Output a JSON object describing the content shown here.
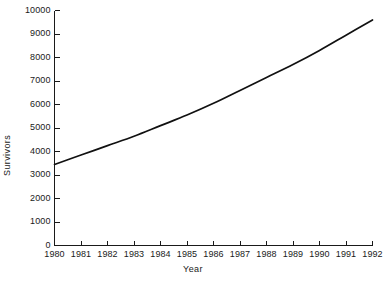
{
  "chart_data": {
    "type": "line",
    "title": "",
    "subtitle": "",
    "xlabel": "Year",
    "ylabel": "Survivors",
    "grid": false,
    "legend": false,
    "legend_position": "none",
    "line_color": "#111111",
    "background_color": "#ffffff",
    "axis_color": "#1a1a1a",
    "xlim": [
      1980,
      1992
    ],
    "ylim": [
      0,
      10000
    ],
    "x_tick_labels": [
      "1980",
      "1981",
      "1982",
      "1983",
      "1984",
      "1985",
      "1986",
      "1987",
      "1988",
      "1989",
      "1990",
      "1991",
      "1992"
    ],
    "y_tick_labels": [
      "0",
      "1000",
      "2000",
      "3000",
      "4000",
      "5000",
      "6000",
      "7000",
      "8000",
      "9000",
      "10000"
    ],
    "x_ticks": [
      1980,
      1981,
      1982,
      1983,
      1984,
      1985,
      1986,
      1987,
      1988,
      1989,
      1990,
      1991,
      1992
    ],
    "y_ticks": [
      0,
      1000,
      2000,
      3000,
      4000,
      5000,
      6000,
      7000,
      8000,
      9000,
      10000
    ],
    "tick_direction": "in",
    "series": [
      {
        "name": "Survivors",
        "x": [
          1980,
          1981,
          1982,
          1983,
          1984,
          1985,
          1986,
          1987,
          1988,
          1989,
          1990,
          1991,
          1992
        ],
        "values": [
          3450,
          3850,
          4250,
          4650,
          5100,
          5550,
          6050,
          6600,
          7150,
          7700,
          8300,
          8950,
          9600
        ]
      }
    ]
  }
}
